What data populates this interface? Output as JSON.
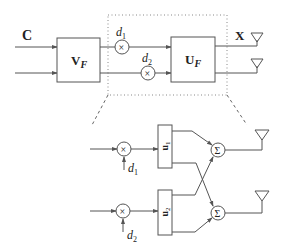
{
  "diagram": {
    "top": {
      "input_label": "C",
      "precoder_left": {
        "main": "V",
        "sub": "F"
      },
      "precoder_right": {
        "main": "U",
        "sub": "F"
      },
      "output_label": "X",
      "scale1": {
        "main": "d",
        "sub": "1"
      },
      "scale2": {
        "main": "d",
        "sub": "2"
      },
      "multiplier_symbol": "×"
    },
    "detail": {
      "box1": {
        "main": "u",
        "sub": "1"
      },
      "box2": {
        "main": "u",
        "sub": "2"
      },
      "scale1": {
        "main": "d",
        "sub": "1"
      },
      "scale2": {
        "main": "d",
        "sub": "2"
      },
      "multiplier_symbol": "×",
      "sum_symbol": "Σ"
    }
  }
}
